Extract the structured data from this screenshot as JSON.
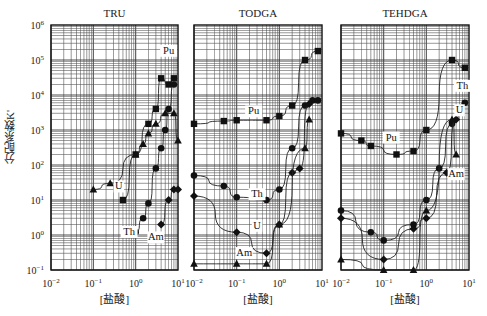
{
  "figure": {
    "ylabel": "分配系数K'",
    "xlabel": "[盐酸]",
    "y_ticks": [
      "10^6",
      "10^5",
      "10^4",
      "10^3",
      "10^2",
      "10^1",
      "10^0",
      "10^-1"
    ],
    "x_ticks": [
      "10^-2",
      "10^-1",
      "10^0",
      "10^1"
    ]
  },
  "chart_data": [
    {
      "type": "scatter",
      "title": "TRU",
      "xlabel": "[盐酸]",
      "ylabel": "分配系数K'",
      "xscale": "log",
      "yscale": "log",
      "xlim": [
        0.01,
        10
      ],
      "ylim": [
        0.1,
        1000000
      ],
      "grid": true,
      "series": [
        {
          "name": "Pu",
          "marker": "square",
          "x": [
            0.5,
            1,
            2,
            3,
            4,
            6,
            8
          ],
          "y": [
            10,
            200,
            1500,
            4000,
            30000,
            20000,
            30000
          ],
          "label_pos": [
            6,
            150000
          ]
        },
        {
          "name": "U",
          "marker": "triangle",
          "x": [
            0.1,
            0.25,
            1,
            1.5,
            2,
            3,
            5,
            8,
            10
          ],
          "y": [
            20,
            30,
            200,
            400,
            800,
            1500,
            3000,
            3000,
            500
          ],
          "label_pos": [
            0.4,
            20
          ]
        },
        {
          "name": "Th",
          "marker": "circle",
          "x": [
            1,
            1.5,
            2,
            3,
            4,
            5,
            6,
            8
          ],
          "y": [
            1.2,
            3,
            8,
            80,
            300,
            1000,
            4000,
            20000
          ],
          "label_pos": [
            0.7,
            1.0
          ]
        },
        {
          "name": "Am",
          "marker": "diamond",
          "x": [
            4,
            6,
            8,
            10
          ],
          "y": [
            2,
            10,
            20,
            20
          ],
          "label_pos": [
            3,
            0.7
          ]
        }
      ]
    },
    {
      "type": "scatter",
      "title": "TODGA",
      "xlabel": "[盐酸]",
      "xscale": "log",
      "yscale": "log",
      "xlim": [
        0.01,
        10
      ],
      "ylim": [
        0.1,
        1000000
      ],
      "grid": true,
      "series": [
        {
          "name": "Pu",
          "marker": "square",
          "x": [
            0.01,
            0.05,
            0.1,
            0.5,
            1,
            2,
            4,
            8
          ],
          "y": [
            1500,
            1800,
            1900,
            1900,
            2500,
            5000,
            100000,
            180000
          ],
          "label_pos": [
            0.25,
            2800
          ]
        },
        {
          "name": "Th",
          "marker": "circle",
          "x": [
            0.01,
            0.05,
            0.1,
            0.5,
            1,
            2,
            4,
            6,
            8
          ],
          "y": [
            50,
            25,
            12,
            10,
            20,
            300,
            5000,
            7000,
            7000
          ],
          "label_pos": [
            0.3,
            12
          ]
        },
        {
          "name": "U",
          "marker": "diamond",
          "x": [
            0.01,
            0.1,
            0.5,
            1,
            2,
            3,
            5
          ],
          "y": [
            13,
            1.2,
            0.3,
            2,
            60,
            80,
            5500
          ],
          "label_pos": [
            0.3,
            1.5
          ]
        },
        {
          "name": "Am",
          "marker": "triangle",
          "x": [
            0.01,
            0.1,
            0.5,
            1,
            4,
            5
          ],
          "y": [
            0.15,
            0.15,
            0.15,
            2,
            300,
            2000
          ],
          "label_pos": [
            0.15,
            0.25
          ]
        }
      ]
    },
    {
      "type": "scatter",
      "title": "TEHDGA",
      "xlabel": "[盐酸]",
      "xscale": "log",
      "yscale": "log",
      "xlim": [
        0.01,
        10
      ],
      "ylim": [
        0.1,
        1000000
      ],
      "grid": true,
      "series": [
        {
          "name": "Pu",
          "marker": "square",
          "x": [
            0.01,
            0.03,
            0.05,
            0.2,
            0.5,
            1,
            4,
            8
          ],
          "y": [
            800,
            500,
            350,
            200,
            250,
            1000,
            100000,
            60000
          ],
          "label_pos": [
            0.15,
            500
          ]
        },
        {
          "name": "Th",
          "marker": "circle",
          "x": [
            0.01,
            0.05,
            0.1,
            0.5,
            1,
            2,
            4,
            8
          ],
          "y": [
            5,
            1.2,
            0.7,
            2,
            10,
            80,
            1500,
            6000
          ],
          "label_pos": [
            7,
            15000
          ]
        },
        {
          "name": "U",
          "marker": "diamond",
          "x": [
            0.01,
            0.1,
            0.5,
            1,
            3,
            5
          ],
          "y": [
            3,
            0.2,
            1.5,
            3,
            60,
            2000
          ],
          "label_pos": [
            6,
            3000
          ]
        },
        {
          "name": "Am",
          "marker": "triangle",
          "x": [
            0.01,
            0.1,
            0.5,
            1,
            4,
            5
          ],
          "y": [
            0.2,
            0.1,
            0.1,
            5,
            2000,
            200
          ],
          "label_pos": [
            5,
            45
          ]
        }
      ]
    }
  ]
}
